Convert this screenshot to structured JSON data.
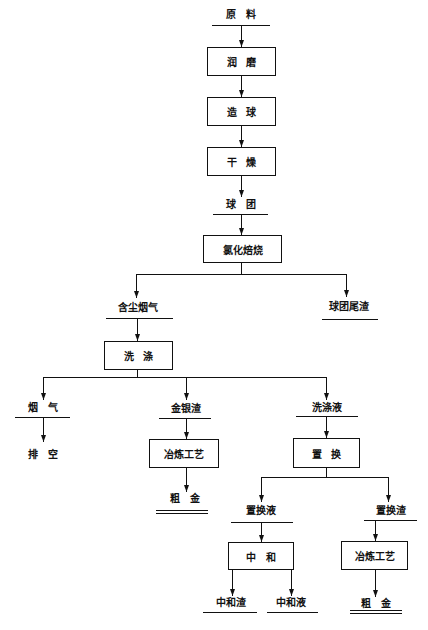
{
  "diagram": {
    "type": "process-flowchart",
    "colors": {
      "line": "#111111",
      "background": "#ffffff",
      "text": "#111111"
    },
    "materials": {
      "raw_material": "原 料",
      "pellets": "球 团",
      "dusty_flue_gas": "含尘烟气",
      "pellet_tailings": "球团尾渣",
      "flue_gas": "烟 气",
      "vent": "排 空",
      "gold_silver_residue": "金银渣",
      "crude_gold_left": "粗 金",
      "wash_liquor": "洗涤液",
      "replacement_liquor": "置换液",
      "replacement_residue": "置换渣",
      "neutralization_residue": "中和渣",
      "neutralization_liquor": "中和液",
      "crude_gold_right": "粗 金"
    },
    "processes": {
      "grinding": "润 磨",
      "pelletizing": "造 球",
      "drying": "干 燥",
      "chlorination_roasting": "氯化焙烧",
      "washing": "洗 涤",
      "smelting_left": "冶炼工艺",
      "replacement": "置 换",
      "neutralization": "中 和",
      "smelting_right": "冶炼工艺"
    },
    "edges": [
      {
        "from": "raw_material",
        "to": "grinding"
      },
      {
        "from": "grinding",
        "to": "pelletizing"
      },
      {
        "from": "pelletizing",
        "to": "drying"
      },
      {
        "from": "drying",
        "to": "pellets"
      },
      {
        "from": "pellets",
        "to": "chlorination_roasting"
      },
      {
        "from": "chlorination_roasting",
        "to": "dusty_flue_gas"
      },
      {
        "from": "chlorination_roasting",
        "to": "pellet_tailings"
      },
      {
        "from": "dusty_flue_gas",
        "to": "washing"
      },
      {
        "from": "washing",
        "to": "flue_gas"
      },
      {
        "from": "washing",
        "to": "gold_silver_residue"
      },
      {
        "from": "washing",
        "to": "wash_liquor"
      },
      {
        "from": "flue_gas",
        "to": "vent"
      },
      {
        "from": "gold_silver_residue",
        "to": "smelting_left"
      },
      {
        "from": "smelting_left",
        "to": "crude_gold_left"
      },
      {
        "from": "wash_liquor",
        "to": "replacement"
      },
      {
        "from": "replacement",
        "to": "replacement_liquor"
      },
      {
        "from": "replacement",
        "to": "replacement_residue"
      },
      {
        "from": "replacement_liquor",
        "to": "neutralization"
      },
      {
        "from": "neutralization",
        "to": "neutralization_residue"
      },
      {
        "from": "neutralization",
        "to": "neutralization_liquor"
      },
      {
        "from": "replacement_residue",
        "to": "smelting_right"
      },
      {
        "from": "smelting_right",
        "to": "crude_gold_right"
      }
    ]
  }
}
